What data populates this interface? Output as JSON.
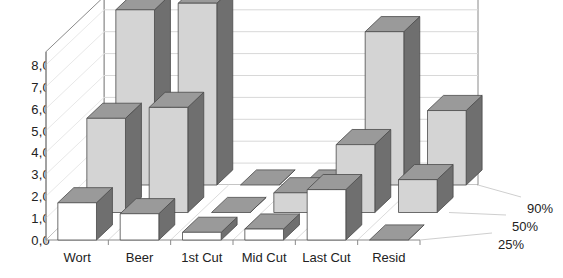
{
  "chart_data": {
    "type": "bar",
    "title": "",
    "subtitle": "",
    "xlabel": "",
    "ylabel": "",
    "categories": [
      "Wort",
      "Beer",
      "1st Cut",
      "Mid Cut",
      "Last Cut",
      "Resid"
    ],
    "series": [
      {
        "name": "25%",
        "values": [
          1.7,
          1.2,
          0.35,
          0.5,
          2.3,
          0.0
        ]
      },
      {
        "name": "50%",
        "values": [
          4.3,
          4.8,
          0.0,
          0.9,
          3.1,
          1.5
        ]
      },
      {
        "name": "90%",
        "values": [
          8.0,
          8.3,
          0.0,
          0.0,
          7.0,
          3.4
        ]
      }
    ],
    "ytick_labels": [
      "0,0",
      "1,0",
      "2,0",
      "3,0",
      "4,0",
      "5,0",
      "6,0",
      "7,0",
      "8,0"
    ],
    "ytick_values": [
      0,
      1,
      2,
      3,
      4,
      5,
      6,
      7,
      8
    ],
    "ylim": [
      0,
      8.6
    ],
    "grid": true,
    "legend_position": "right-depth-axis",
    "projection": "3d-isometric",
    "colors": {
      "front_face_series_25": "#ffffff",
      "front_face_series_50": "#d4d4d4",
      "front_face_series_90": "#d4d4d4",
      "top_face": "#9a9a9a",
      "side_face": "#6f6f6f",
      "outline": "#4a4a4a",
      "gridline": "#d8d8d8",
      "axis": "#8a8a8a",
      "text": "#222222",
      "background": "#ffffff"
    }
  }
}
